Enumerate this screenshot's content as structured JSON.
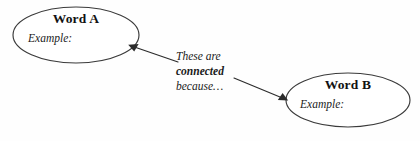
{
  "diagram": {
    "background_color": "#fefefe",
    "stroke_color": "#2b2b2b",
    "text_color": "#1a1a1a",
    "nodes": [
      {
        "id": "word-a",
        "title": "Word A",
        "example_label": "Example:",
        "shape": "ellipse",
        "cx": 76,
        "cy": 35,
        "rx": 63,
        "ry": 28
      },
      {
        "id": "word-b",
        "title": "Word B",
        "example_label": "Example:",
        "shape": "ellipse",
        "cx": 348,
        "cy": 100,
        "rx": 62,
        "ry": 27
      }
    ],
    "caption": {
      "line1": "These are",
      "line2": "connected",
      "line3": "because…"
    },
    "connectors": [
      {
        "id": "arrow-to-word-a",
        "from_x": 178,
        "from_y": 62,
        "to_x": 129,
        "to_y": 45,
        "arrowhead": "solid-triangle",
        "direction": "left-up"
      },
      {
        "id": "arrow-to-word-b",
        "from_x": 234,
        "from_y": 78,
        "to_x": 287,
        "to_y": 100,
        "arrowhead": "solid-triangle",
        "direction": "right-down"
      }
    ]
  }
}
